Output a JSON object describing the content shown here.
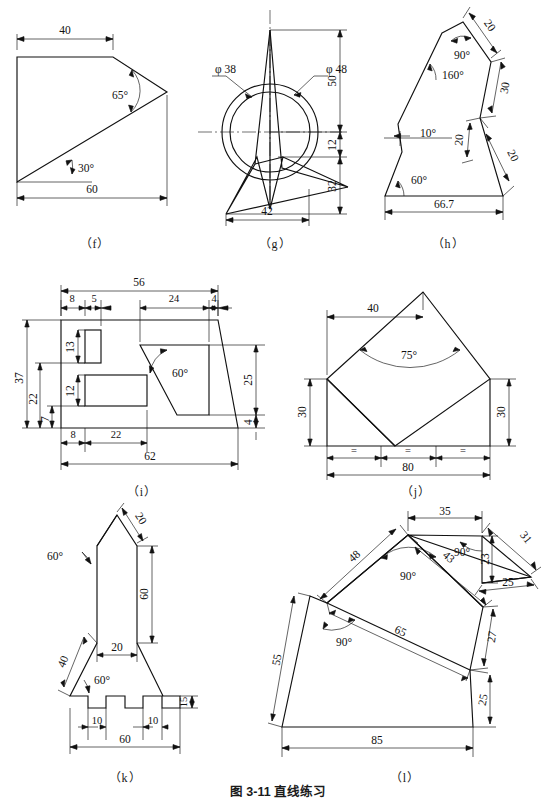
{
  "page": {
    "caption": "图 3-11  直线练习",
    "figure_labels": [
      "（f）",
      "（g）",
      "（h）",
      "（i）",
      "（j）",
      "（k）",
      "（l）"
    ]
  },
  "figures": {
    "f": {
      "label": "（f）",
      "dims": [
        "40",
        "60"
      ],
      "angles": [
        "65°",
        "30°"
      ]
    },
    "g": {
      "label": "（g）",
      "diameters": [
        "φ 38",
        "φ 48"
      ],
      "dims": [
        "50",
        "12",
        "32",
        "42"
      ]
    },
    "h": {
      "label": "（h）",
      "dims": [
        "20",
        "30",
        "20",
        "20",
        "66.7"
      ],
      "angles": [
        "90°",
        "160°",
        "10°",
        "60°"
      ]
    },
    "i": {
      "label": "（i）",
      "dims_top": [
        "56",
        "8",
        "5",
        "24",
        "4"
      ],
      "dims_left": [
        "37",
        "22",
        "7",
        "13",
        "12"
      ],
      "dims_right": [
        "25",
        "4"
      ],
      "dims_bottom": [
        "8",
        "22",
        "62"
      ],
      "angles": [
        "60°"
      ]
    },
    "j": {
      "label": "（j）",
      "dims": [
        "40",
        "30",
        "30",
        "80"
      ],
      "angles": [
        "75°"
      ],
      "equal_marks": [
        "=",
        "=",
        "="
      ]
    },
    "k": {
      "label": "（k）",
      "dims": [
        "20",
        "60",
        "20",
        "40",
        "10",
        "10",
        "60",
        "15"
      ],
      "angles": [
        "60°",
        "60°"
      ]
    },
    "l": {
      "label": "（l）",
      "dims": [
        "35",
        "31",
        "23",
        "25",
        "43",
        "48",
        "65",
        "27",
        "25",
        "55",
        "85"
      ],
      "angles": [
        "90°",
        "90°",
        "90°"
      ]
    }
  }
}
